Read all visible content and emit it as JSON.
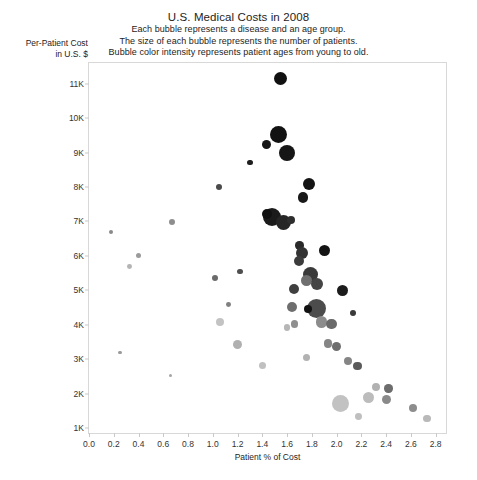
{
  "chart_data": {
    "type": "scatter",
    "title": "U.S. Medical Costs in 2008",
    "subtitle_lines": [
      "Each bubble represents a disease and an age group.",
      "The size of each bubble represents the number of patients.",
      "Bubble color intensity represents patient ages from young to old."
    ],
    "xlabel": "Patient % of Cost",
    "ylabel_lines": [
      "Per-Patient Cost",
      "in U.S. $"
    ],
    "xlim": [
      0.0,
      2.9
    ],
    "ylim": [
      0.8,
      11.6
    ],
    "xticks": [
      "0.0",
      "0.2",
      "0.4",
      "0.6",
      "0.8",
      "1.0",
      "1.2",
      "1.4",
      "1.6",
      "1.8",
      "2.0",
      "2.2",
      "2.4",
      "2.6",
      "2.8"
    ],
    "xtick_values": [
      0.0,
      0.2,
      0.4,
      0.6,
      0.8,
      1.0,
      1.2,
      1.4,
      1.6,
      1.8,
      2.0,
      2.2,
      2.4,
      2.6,
      2.8
    ],
    "yticks": [
      "1K",
      "2K",
      "3K",
      "4K",
      "5K",
      "6K",
      "7K",
      "8K",
      "9K",
      "10K",
      "11K"
    ],
    "ytick_values": [
      1,
      2,
      3,
      4,
      5,
      6,
      7,
      8,
      9,
      10,
      11
    ],
    "grid": false,
    "legend": "none",
    "size_encodes": "number of patients",
    "color_encodes": "patient age (light = young, dark = old)",
    "points": [
      {
        "x": 1.55,
        "y": 11.15,
        "r": 6.5,
        "c": "#111111"
      },
      {
        "x": 1.53,
        "y": 9.52,
        "r": 8.5,
        "c": "#121212"
      },
      {
        "x": 1.43,
        "y": 9.22,
        "r": 4.5,
        "c": "#161616"
      },
      {
        "x": 1.6,
        "y": 8.98,
        "r": 8.0,
        "c": "#161616"
      },
      {
        "x": 1.3,
        "y": 8.72,
        "r": 2.6,
        "c": "#1e1e1e"
      },
      {
        "x": 1.78,
        "y": 8.08,
        "r": 6.0,
        "c": "#141414"
      },
      {
        "x": 1.73,
        "y": 7.7,
        "r": 5.2,
        "c": "#191919"
      },
      {
        "x": 1.05,
        "y": 8.0,
        "r": 3.2,
        "c": "#4a4a4a"
      },
      {
        "x": 1.48,
        "y": 7.12,
        "r": 9.0,
        "c": "#1b1b1b"
      },
      {
        "x": 1.57,
        "y": 6.98,
        "r": 7.5,
        "c": "#262626"
      },
      {
        "x": 1.44,
        "y": 7.22,
        "r": 5.0,
        "c": "#111111"
      },
      {
        "x": 1.63,
        "y": 7.05,
        "r": 4.0,
        "c": "#2e2e2e"
      },
      {
        "x": 0.67,
        "y": 6.98,
        "r": 3.0,
        "c": "#8e8e8e"
      },
      {
        "x": 0.18,
        "y": 6.7,
        "r": 2.2,
        "c": "#8a8a8a"
      },
      {
        "x": 1.7,
        "y": 6.3,
        "r": 4.2,
        "c": "#2a2a2a"
      },
      {
        "x": 1.72,
        "y": 6.08,
        "r": 6.2,
        "c": "#333333"
      },
      {
        "x": 1.7,
        "y": 5.85,
        "r": 5.0,
        "c": "#3c3c3c"
      },
      {
        "x": 1.9,
        "y": 6.15,
        "r": 5.5,
        "c": "#141414"
      },
      {
        "x": 0.4,
        "y": 6.02,
        "r": 2.6,
        "c": "#9b9b9b"
      },
      {
        "x": 0.33,
        "y": 5.7,
        "r": 2.4,
        "c": "#b4b4b4"
      },
      {
        "x": 1.79,
        "y": 5.45,
        "r": 7.5,
        "c": "#3a3a3a"
      },
      {
        "x": 1.76,
        "y": 5.3,
        "r": 5.5,
        "c": "#6f6f6f"
      },
      {
        "x": 1.84,
        "y": 5.18,
        "r": 6.0,
        "c": "#454545"
      },
      {
        "x": 1.66,
        "y": 5.05,
        "r": 5.0,
        "c": "#3f3f3f"
      },
      {
        "x": 1.22,
        "y": 5.55,
        "r": 2.6,
        "c": "#4f4f4f"
      },
      {
        "x": 1.02,
        "y": 5.35,
        "r": 3.2,
        "c": "#6b6b6b"
      },
      {
        "x": 2.05,
        "y": 5.0,
        "r": 5.5,
        "c": "#1c1c1c"
      },
      {
        "x": 1.64,
        "y": 4.52,
        "r": 5.0,
        "c": "#6e6e6e"
      },
      {
        "x": 1.84,
        "y": 4.48,
        "r": 9.5,
        "c": "#4c4c4c"
      },
      {
        "x": 1.77,
        "y": 4.46,
        "r": 4.0,
        "c": "#121212"
      },
      {
        "x": 2.13,
        "y": 4.35,
        "r": 3.0,
        "c": "#3a3a3a"
      },
      {
        "x": 1.13,
        "y": 4.58,
        "r": 2.4,
        "c": "#808080"
      },
      {
        "x": 1.88,
        "y": 4.08,
        "r": 5.6,
        "c": "#8c8c8c"
      },
      {
        "x": 1.96,
        "y": 4.02,
        "r": 5.2,
        "c": "#6a6a6a"
      },
      {
        "x": 1.66,
        "y": 4.02,
        "r": 3.6,
        "c": "#8f8f8f"
      },
      {
        "x": 1.6,
        "y": 3.92,
        "r": 3.2,
        "c": "#b6b6b6"
      },
      {
        "x": 1.06,
        "y": 4.08,
        "r": 4.2,
        "c": "#c3c3c3"
      },
      {
        "x": 1.2,
        "y": 3.42,
        "r": 4.6,
        "c": "#b0b0b0"
      },
      {
        "x": 1.93,
        "y": 3.45,
        "r": 4.4,
        "c": "#858585"
      },
      {
        "x": 2.0,
        "y": 3.38,
        "r": 4.6,
        "c": "#6e6e6e"
      },
      {
        "x": 1.76,
        "y": 3.05,
        "r": 3.6,
        "c": "#b2b2b2"
      },
      {
        "x": 0.25,
        "y": 3.2,
        "r": 1.6,
        "c": "#9a9a9a"
      },
      {
        "x": 1.4,
        "y": 2.82,
        "r": 3.6,
        "c": "#c0c0c0"
      },
      {
        "x": 2.09,
        "y": 2.95,
        "r": 4.0,
        "c": "#858585"
      },
      {
        "x": 2.17,
        "y": 2.8,
        "r": 4.2,
        "c": "#5b5b5b"
      },
      {
        "x": 0.66,
        "y": 2.52,
        "r": 1.5,
        "c": "#a5a5a5"
      },
      {
        "x": 2.32,
        "y": 2.2,
        "r": 4.2,
        "c": "#b1b1b1"
      },
      {
        "x": 2.42,
        "y": 2.15,
        "r": 4.2,
        "c": "#6d6d6d"
      },
      {
        "x": 2.03,
        "y": 1.72,
        "r": 8.5,
        "c": "#c2c2c2"
      },
      {
        "x": 2.26,
        "y": 1.88,
        "r": 5.6,
        "c": "#bcbcbc"
      },
      {
        "x": 2.4,
        "y": 1.82,
        "r": 4.6,
        "c": "#8a8a8a"
      },
      {
        "x": 2.62,
        "y": 1.58,
        "r": 4.0,
        "c": "#8d8d8d"
      },
      {
        "x": 2.18,
        "y": 1.33,
        "r": 3.4,
        "c": "#bfbfbf"
      },
      {
        "x": 2.73,
        "y": 1.28,
        "r": 3.6,
        "c": "#b9b9b9"
      }
    ]
  }
}
